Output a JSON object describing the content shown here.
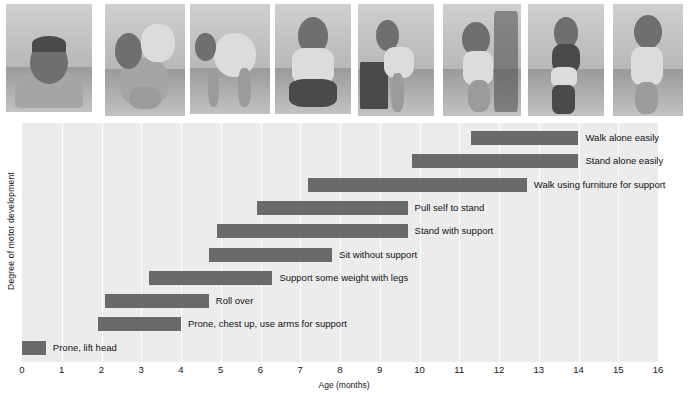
{
  "figure": {
    "y_axis_label": "Degree of motor development",
    "x_axis_label": "Age (months)"
  },
  "photos": [
    {
      "name": "baby-prone-lifting-head",
      "alt": "Infant lying prone lifting head and chest"
    },
    {
      "name": "baby-rolling-over",
      "alt": "Infant rolling over"
    },
    {
      "name": "baby-supporting-weight-on-legs",
      "alt": "Infant bearing weight on legs, hands on floor"
    },
    {
      "name": "baby-sitting-without-support",
      "alt": "Infant sitting unsupported"
    },
    {
      "name": "baby-pulling-self-to-stand",
      "alt": "Infant pulling self up on furniture"
    },
    {
      "name": "baby-standing-with-support",
      "alt": "Infant standing while holding on"
    },
    {
      "name": "baby-walking-with-support",
      "alt": "Infant walking while held by adult hands"
    },
    {
      "name": "baby-walking-alone",
      "alt": "Toddler walking alone"
    }
  ],
  "chart_data": {
    "type": "bar",
    "orientation": "horizontal",
    "subtype": "range-bar",
    "title": "",
    "xlabel": "Age (months)",
    "ylabel": "Degree of motor development",
    "xlim": [
      0,
      16
    ],
    "xticks": [
      0,
      1,
      2,
      3,
      4,
      5,
      6,
      7,
      8,
      9,
      10,
      11,
      12,
      13,
      14,
      15,
      16
    ],
    "xtick_labels": [
      "0",
      "1",
      "2",
      "3",
      "4",
      "5",
      "6",
      "7",
      "8",
      "9",
      "10",
      "11",
      "12",
      "13",
      "14",
      "15",
      "16"
    ],
    "grid": "vertical",
    "legend": "none",
    "bar_color": "#6a6a6a",
    "plot_background": "#ececed",
    "categories": [
      "Walk alone easily",
      "Stand alone easily",
      "Walk using furniture for support",
      "Pull self to stand",
      "Stand with support",
      "Sit without support",
      "Support some weight with legs",
      "Roll over",
      "Prone, chest up, use arms for support",
      "Prone, lift head"
    ],
    "ranges": [
      {
        "label": "Walk alone easily",
        "start": 11.3,
        "end": 14.0
      },
      {
        "label": "Stand alone easily",
        "start": 9.8,
        "end": 14.0
      },
      {
        "label": "Walk using furniture for support",
        "start": 7.2,
        "end": 12.7
      },
      {
        "label": "Pull self to stand",
        "start": 5.9,
        "end": 9.7
      },
      {
        "label": "Stand with support",
        "start": 4.9,
        "end": 9.7
      },
      {
        "label": "Sit without support",
        "start": 4.7,
        "end": 7.8
      },
      {
        "label": "Support some weight with legs",
        "start": 3.2,
        "end": 6.3
      },
      {
        "label": "Roll over",
        "start": 2.1,
        "end": 4.7
      },
      {
        "label": "Prone, chest up, use arms for support",
        "start": 1.9,
        "end": 4.0
      },
      {
        "label": "Prone, lift head",
        "start": 0.0,
        "end": 0.6
      }
    ]
  }
}
